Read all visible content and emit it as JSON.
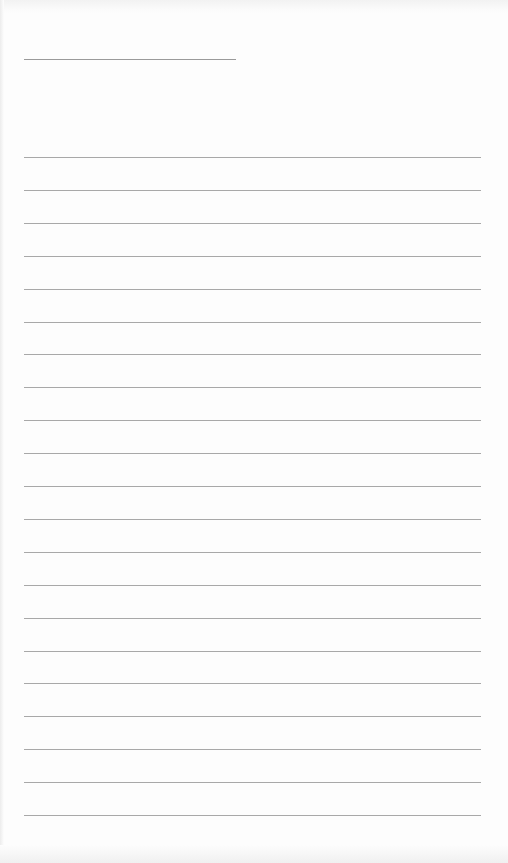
{
  "document": {
    "type": "lined-paper",
    "background_color": "#fdfdfd",
    "rule_color": "#a8a8a8",
    "title_line": {
      "x": 24,
      "y": 59,
      "width": 212
    },
    "rules": {
      "count": 21,
      "first_y": 157,
      "spacing": 32.9,
      "x": 24,
      "width": 457
    }
  }
}
